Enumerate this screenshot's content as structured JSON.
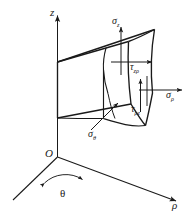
{
  "figure": {
    "kind": "stress-element-cylindrical-coordinates",
    "background_color": "#ffffff",
    "stroke_color": "#1a1a1a",
    "axes": [
      {
        "id": "z",
        "label": "z",
        "label_sub": "",
        "direction": "vertical-up"
      },
      {
        "id": "rho",
        "label": "ρ",
        "label_sub": "",
        "direction": "lower-right"
      },
      {
        "id": "theta",
        "label": "θ",
        "label_sub": "",
        "direction": "lower-left"
      }
    ],
    "origin": {
      "label": "O"
    },
    "angle": {
      "label": "θ"
    },
    "stresses": [
      {
        "id": "sigma-z",
        "symbol": "σ",
        "subscript": "z",
        "kind": "normal",
        "face": "top",
        "arrow": "up"
      },
      {
        "id": "tau-z-rho",
        "symbol": "τ",
        "subscript": "zρ",
        "kind": "shear",
        "face": "top",
        "arrow": "right"
      },
      {
        "id": "sigma-rho",
        "symbol": "σ",
        "subscript": "ρ",
        "kind": "normal",
        "face": "outer-curved",
        "arrow": "right"
      },
      {
        "id": "tau-rho-z",
        "symbol": "τ",
        "subscript": "ρz",
        "kind": "shear",
        "face": "outer-curved",
        "arrow": "up"
      },
      {
        "id": "sigma-theta",
        "symbol": "σ",
        "subscript": "θ",
        "kind": "normal",
        "face": "front-radial",
        "arrow": "upper-right"
      }
    ]
  },
  "labels": {
    "axis_z": "z",
    "axis_rho": "ρ",
    "origin": "O",
    "angle_theta": "θ",
    "sigma": "σ",
    "tau": "τ",
    "sub_z": "z",
    "sub_rho": "ρ",
    "sub_theta": "θ",
    "sub_zrho": "zρ",
    "sub_rhoz": "ρz"
  }
}
